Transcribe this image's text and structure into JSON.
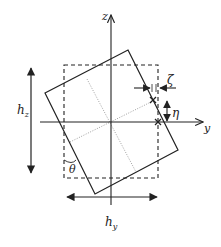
{
  "diagram": {
    "type": "rotated-cross-section",
    "labels": {
      "z_axis": "z",
      "y_axis": "y",
      "h_z": "h",
      "h_z_sub": "z",
      "h_y": "h",
      "h_y_sub": "y",
      "theta": "θ",
      "zeta": "ζ",
      "eta": "η"
    },
    "colors": {
      "line": "#222222",
      "dotted": "#777777",
      "background": "#ffffff"
    }
  }
}
